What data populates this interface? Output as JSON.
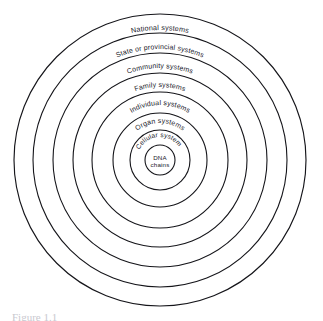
{
  "figure": {
    "type": "concentric-rings-diagram",
    "background_color": "#ffffff",
    "stroke_color": "#15151a",
    "text_color": "#20202a",
    "center": {
      "x": 160,
      "y": 160
    },
    "caption_partial": "Figure 1.1",
    "rings": [
      {
        "index": 0,
        "label": "National systems",
        "radius": 146,
        "stroke_width": 1.15,
        "label_radius": 130,
        "label_font_size": 7.2,
        "has_label": true
      },
      {
        "index": 1,
        "label": "State or provincial systems",
        "radius": 127,
        "stroke_width": 1.1,
        "label_radius": 111,
        "label_font_size": 7.0,
        "has_label": true
      },
      {
        "index": 2,
        "label": "Community systems",
        "radius": 107,
        "stroke_width": 1.1,
        "label_radius": 92,
        "label_font_size": 7.0,
        "has_label": true
      },
      {
        "index": 3,
        "label": "Family systems",
        "radius": 87,
        "stroke_width": 1.1,
        "label_radius": 73,
        "label_font_size": 7.0,
        "has_label": true
      },
      {
        "index": 4,
        "label": "Individual systems",
        "radius": 68,
        "stroke_width": 1.1,
        "label_radius": 55,
        "label_font_size": 7.0,
        "has_label": true
      },
      {
        "index": 5,
        "label": "Organ systems",
        "radius": 47,
        "stroke_width": 1.1,
        "label_radius": 37,
        "label_font_size": 7.0,
        "has_label": true
      },
      {
        "index": 6,
        "label": "Cellular systems",
        "radius": 30,
        "stroke_width": 1.1,
        "label_radius": 23,
        "label_font_size": 6.6,
        "has_label": true
      },
      {
        "index": 7,
        "label": "DNA chains",
        "radius": 15,
        "stroke_width": 1.1,
        "label_radius": 0,
        "label_font_size": 6.2,
        "has_label": false
      }
    ],
    "center_label": {
      "line1": "DNA",
      "line2": "chains",
      "font_size": 6.2
    }
  }
}
